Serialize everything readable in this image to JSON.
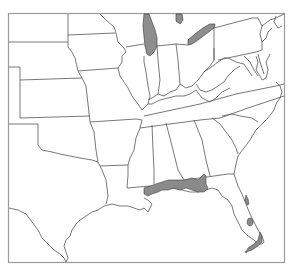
{
  "map": {
    "region": "Eastern and Central United States",
    "style": "grayscale outline map",
    "colors": {
      "background": "#ffffff",
      "state_border": "#555555",
      "frame": "#9a9a9a",
      "shaded_area": "#8a8a8a",
      "water_body": "#8e8e8e"
    },
    "shaded_regions": [
      {
        "name": "gulf-coast-range",
        "description": "Coastal band from southeastern Louisiana through Mississippi, Alabama and the Florida panhandle"
      },
      {
        "name": "florida-atlantic-coast",
        "description": "Small patch on northeast Florida Atlantic coast"
      },
      {
        "name": "florida-southeast-coast",
        "description": "Southeast Florida coast and Keys"
      },
      {
        "name": "lake-okeechobee",
        "description": "Inland lake in south Florida"
      }
    ],
    "water_bodies": [
      "Lake Michigan",
      "Lake Huron (partial)",
      "Lake Erie"
    ]
  }
}
